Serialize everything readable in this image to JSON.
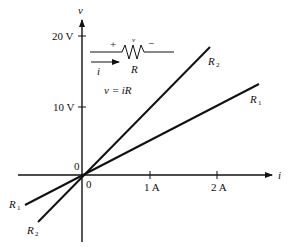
{
  "diagram": {
    "axes": {
      "x_label": "i",
      "y_label": "v",
      "origin_label_upper": "0",
      "origin_label_lower": "0",
      "x_ticks": [
        "1 A",
        "2 A"
      ],
      "y_ticks": [
        "20 V",
        "10 V"
      ]
    },
    "lines": [
      {
        "name": "R",
        "subscript": "2",
        "description": "steeper line (larger resistance)"
      },
      {
        "name": "R",
        "subscript": "1",
        "description": "shallower line (smaller resistance)"
      }
    ],
    "circuit": {
      "plus": "+",
      "minus": "−",
      "voltage": "v",
      "current": "i",
      "resistor": "R"
    },
    "equation": "v = iR",
    "colors": {
      "ink": "#111111",
      "background": "#ffffff"
    }
  }
}
